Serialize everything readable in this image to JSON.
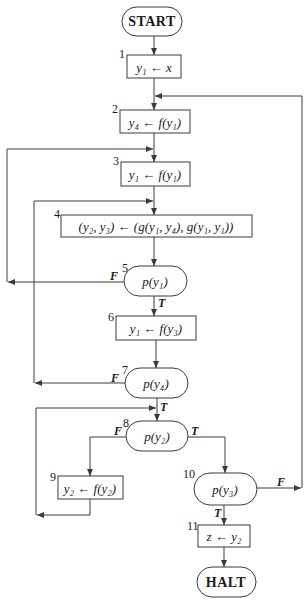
{
  "diagram": {
    "type": "flowchart",
    "colors": {
      "stroke": "#3a3a3a",
      "text": "#1a1a1a",
      "background": "#ffffff"
    },
    "nodes": {
      "start": {
        "kind": "terminal",
        "label": "START"
      },
      "n1": {
        "kind": "process",
        "number": "1",
        "label": "y₁ ← x"
      },
      "n2": {
        "kind": "process",
        "number": "2",
        "label": "y₄ ← f(y₁)"
      },
      "n3": {
        "kind": "process",
        "number": "3",
        "label": "y₁ ← f(y₁)"
      },
      "n4": {
        "kind": "process",
        "number": "4",
        "label": "(y₂, y₃) ← (g(y₁, y₄), g(y₁, y₁))"
      },
      "n5": {
        "kind": "decision",
        "number": "5",
        "label": "p(y₁)"
      },
      "n6": {
        "kind": "process",
        "number": "6",
        "label": "y₁ ← f(y₃)"
      },
      "n7": {
        "kind": "decision",
        "number": "7",
        "label": "p(y₄)"
      },
      "n8": {
        "kind": "decision",
        "number": "8",
        "label": "p(y₂)"
      },
      "n9": {
        "kind": "process",
        "number": "9",
        "label": "y₂ ← f(y₂)"
      },
      "n10": {
        "kind": "decision",
        "number": "10",
        "label": "p(y₃)"
      },
      "n11": {
        "kind": "process",
        "number": "11",
        "label": "z ← y₂"
      },
      "halt": {
        "kind": "terminal",
        "label": "HALT"
      }
    },
    "branch_labels": {
      "n5_false": "F",
      "n5_true": "T",
      "n7_false": "F",
      "n7_true": "T",
      "n8_false": "F",
      "n8_true": "T",
      "n10_false": "F",
      "n10_true": "T"
    },
    "edges": [
      {
        "from": "START",
        "to": "1"
      },
      {
        "from": "1",
        "to": "2"
      },
      {
        "from": "2",
        "to": "3"
      },
      {
        "from": "3",
        "to": "4"
      },
      {
        "from": "4",
        "to": "5"
      },
      {
        "from": "5",
        "to": "6",
        "label": "T"
      },
      {
        "from": "5",
        "to": "3",
        "label": "F"
      },
      {
        "from": "6",
        "to": "7"
      },
      {
        "from": "7",
        "to": "8",
        "label": "T"
      },
      {
        "from": "7",
        "to": "4",
        "label": "F"
      },
      {
        "from": "8",
        "to": "9",
        "label": "F"
      },
      {
        "from": "8",
        "to": "10",
        "label": "T"
      },
      {
        "from": "9",
        "to": "8"
      },
      {
        "from": "10",
        "to": "11",
        "label": "T"
      },
      {
        "from": "10",
        "to": "2",
        "label": "F"
      },
      {
        "from": "11",
        "to": "HALT"
      }
    ]
  }
}
